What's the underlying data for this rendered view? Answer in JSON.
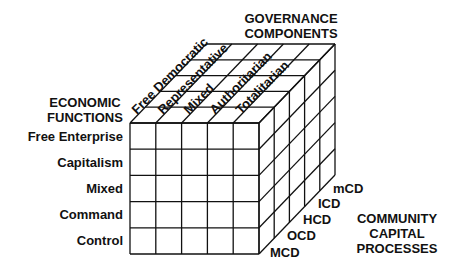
{
  "diagram": {
    "type": "3d-matrix-cube",
    "grid": {
      "rows": 5,
      "columns": 5,
      "depth": 5
    },
    "line_color": "#111111",
    "background": "#ffffff"
  },
  "governance": {
    "title_line1": "GOVERNANCE",
    "title_line2": "COMPONENTS",
    "items": [
      "Free Democratic",
      "Representative",
      "Mixed",
      "Authoritarian",
      "Totalitarian"
    ]
  },
  "economic": {
    "title_line1": "ECONOMIC",
    "title_line2": "FUNCTIONS",
    "items": [
      "Free Enterprise",
      "Capitalism",
      "Mixed",
      "Command",
      "Control"
    ]
  },
  "community": {
    "title_line1": "COMMUNITY",
    "title_line2": "CAPITAL",
    "title_line3": "PROCESSES",
    "items": [
      "MCD",
      "OCD",
      "HCD",
      "ICD",
      "mCD"
    ]
  }
}
